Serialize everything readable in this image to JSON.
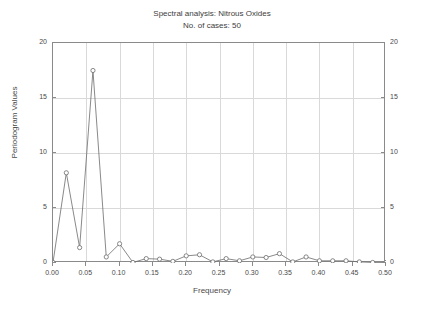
{
  "chart_data": {
    "type": "line",
    "title": "Spectral analysis: Nitrous Oxides",
    "subtitle": "No. of cases: 50",
    "xlabel": "Frequency",
    "ylabel": "Periodogram Values",
    "xlim": [
      0.0,
      0.5
    ],
    "ylim": [
      0,
      20
    ],
    "grid": true,
    "legend": "none",
    "marker": "circle-open",
    "line_color": "#6b6b6b",
    "marker_color": "#6b6b6b",
    "grid_color": "#d9d9d9",
    "axis_color": "#8a8a8a",
    "xticks": [
      "0.00",
      "0.05",
      "0.10",
      "0.15",
      "0.20",
      "0.25",
      "0.30",
      "0.35",
      "0.40",
      "0.45",
      "0.50"
    ],
    "xtick_values": [
      0.0,
      0.05,
      0.1,
      0.15,
      0.2,
      0.25,
      0.3,
      0.35,
      0.4,
      0.45,
      0.5
    ],
    "yticks": [
      "0",
      "5",
      "10",
      "15",
      "20"
    ],
    "ytick_values": [
      0,
      5,
      10,
      15,
      20
    ],
    "yticks_right": [
      "0",
      "5",
      "10",
      "15",
      "20"
    ],
    "x": [
      0.0,
      0.02,
      0.04,
      0.06,
      0.08,
      0.1,
      0.12,
      0.14,
      0.16,
      0.18,
      0.2,
      0.22,
      0.24,
      0.26,
      0.28,
      0.3,
      0.32,
      0.34,
      0.36,
      0.38,
      0.4,
      0.42,
      0.44,
      0.46,
      0.48,
      0.5
    ],
    "y": [
      0.05,
      8.2,
      1.4,
      17.5,
      0.55,
      1.75,
      0.05,
      0.4,
      0.35,
      0.15,
      0.65,
      0.75,
      0.1,
      0.4,
      0.2,
      0.55,
      0.5,
      0.85,
      0.1,
      0.55,
      0.2,
      0.2,
      0.2,
      0.1,
      0.05,
      0.05
    ],
    "series_name": "Periodogram"
  }
}
